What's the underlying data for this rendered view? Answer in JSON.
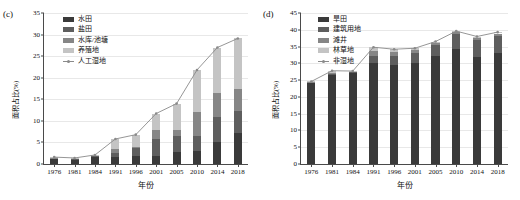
{
  "figure": {
    "panels": [
      {
        "tag": "(c)",
        "ylabel": "面积占比(%)",
        "xlabel": "年份",
        "legend": [
          {
            "label": "水田",
            "color": "#3a3a3a",
            "type": "swatch"
          },
          {
            "label": "盐田",
            "color": "#5e5e5e",
            "type": "swatch"
          },
          {
            "label": "水库/池塘",
            "color": "#868686",
            "type": "swatch"
          },
          {
            "label": "养殖地",
            "color": "#c4c4c4",
            "type": "swatch"
          },
          {
            "label": "人工湿地",
            "color": "#8a8a8a",
            "type": "line"
          }
        ]
      },
      {
        "tag": "(d)",
        "ylabel": "面积占比(%)",
        "xlabel": "年份",
        "legend": [
          {
            "label": "旱田",
            "color": "#3a3a3a",
            "type": "swatch"
          },
          {
            "label": "建筑用地",
            "color": "#5e5e5e",
            "type": "swatch"
          },
          {
            "label": "滩井",
            "color": "#868686",
            "type": "swatch"
          },
          {
            "label": "林草地",
            "color": "#c4c4c4",
            "type": "swatch"
          },
          {
            "label": "非湿地",
            "color": "#8a8a8a",
            "type": "line"
          }
        ]
      }
    ]
  },
  "chart_data": [
    {
      "type": "bar",
      "title": "(c)",
      "stacked": true,
      "xlabel": "年份",
      "ylabel": "面积占比(%)",
      "ylim": [
        0,
        35
      ],
      "yticks": [
        0,
        5,
        10,
        15,
        20,
        25,
        30,
        35
      ],
      "grid": true,
      "legend_position": "top-left",
      "categories": [
        "1976",
        "1981",
        "1984",
        "1991",
        "1996",
        "2001",
        "2005",
        "2010",
        "2014",
        "2018"
      ],
      "series": [
        {
          "name": "水田",
          "color": "#3a3a3a",
          "values": [
            1.3,
            1.1,
            1.7,
            1.6,
            1.8,
            1.8,
            2.8,
            3.1,
            5.2,
            7.2
          ]
        },
        {
          "name": "盐田",
          "color": "#5e5e5e",
          "values": [
            0.1,
            0.1,
            0.2,
            0.9,
            2.0,
            4.0,
            3.8,
            3.5,
            5.6,
            5.2
          ]
        },
        {
          "name": "水库/池塘",
          "color": "#868686",
          "values": [
            0.1,
            0.1,
            0.1,
            0.9,
            0.2,
            2.0,
            1.4,
            5.4,
            5.7,
            5.0
          ]
        },
        {
          "name": "养殖地",
          "color": "#c4c4c4",
          "values": [
            0.1,
            0.1,
            0.1,
            2.4,
            2.8,
            3.9,
            6.0,
            9.8,
            10.5,
            11.7
          ]
        }
      ],
      "line_series": {
        "name": "人工湿地",
        "color": "#8a8a8a",
        "marker": "circle",
        "values": [
          1.6,
          1.4,
          2.1,
          5.8,
          6.8,
          11.7,
          14.0,
          21.8,
          27.0,
          29.1
        ]
      }
    },
    {
      "type": "bar",
      "title": "(d)",
      "stacked": true,
      "xlabel": "年份",
      "ylabel": "面积占比(%)",
      "ylim": [
        0,
        45
      ],
      "yticks": [
        0,
        5,
        10,
        15,
        20,
        25,
        30,
        35,
        40,
        45
      ],
      "grid": true,
      "legend_position": "top-left",
      "categories": [
        "1976",
        "1981",
        "1984",
        "1991",
        "1996",
        "2001",
        "2005",
        "2010",
        "2014",
        "2018"
      ],
      "series": [
        {
          "name": "旱田",
          "color": "#3a3a3a",
          "values": [
            24.2,
            26.4,
            27.1,
            30.1,
            29.4,
            30.2,
            32.2,
            34.4,
            31.8,
            33.1
          ]
        },
        {
          "name": "建筑用地",
          "color": "#5e5e5e",
          "values": [
            0.2,
            0.4,
            0.3,
            2.1,
            2.8,
            2.9,
            3.3,
            4.4,
            5.2,
            5.1
          ]
        },
        {
          "name": "滩井",
          "color": "#868686",
          "values": [
            0.1,
            0.4,
            0.2,
            1.5,
            1.2,
            0.8,
            0.6,
            0.5,
            0.6,
            0.7
          ]
        },
        {
          "name": "林草地",
          "color": "#c4c4c4",
          "values": [
            0.1,
            0.6,
            0.1,
            1.1,
            0.8,
            0.6,
            0.4,
            0.3,
            0.4,
            0.4
          ]
        }
      ],
      "line_series": {
        "name": "非湿地",
        "color": "#8a8a8a",
        "marker": "circle",
        "values": [
          24.6,
          27.8,
          27.7,
          34.8,
          34.2,
          34.5,
          36.5,
          39.6,
          38.0,
          39.3
        ]
      }
    }
  ]
}
